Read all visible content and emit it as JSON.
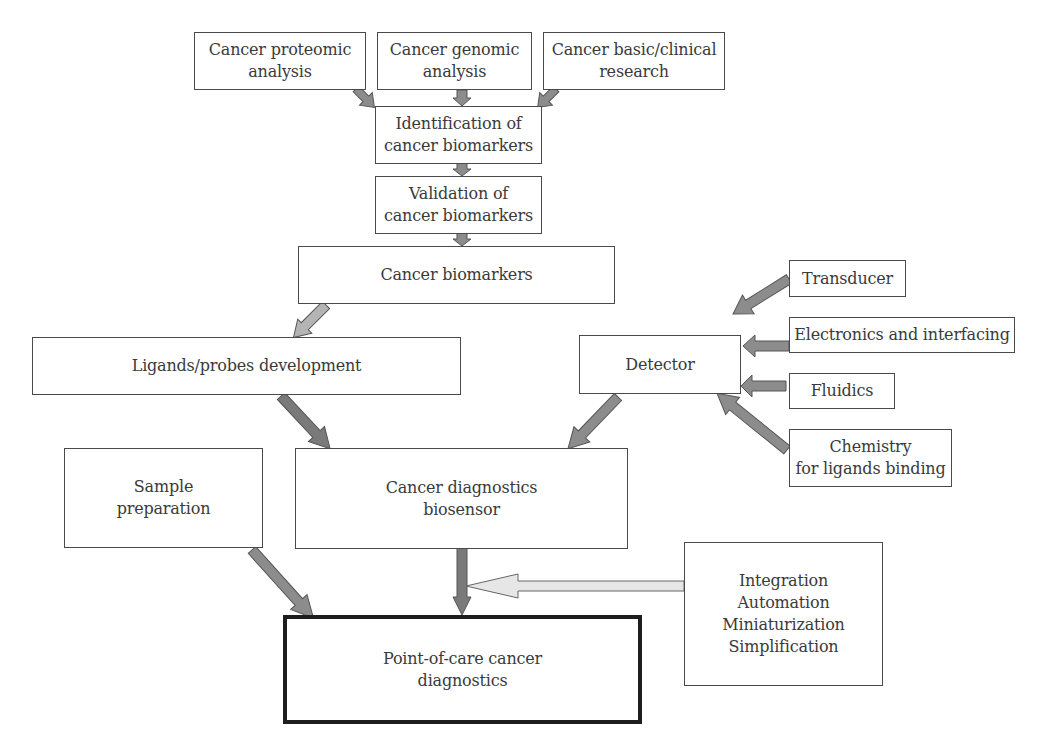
{
  "diagram": {
    "colors": {
      "box_border": "#4a4a4a",
      "final_box_border": "#1e1e1e",
      "arrow_medium": "#8c8c8c",
      "arrow_dark": "#7a7a7a",
      "arrow_light": "#b4b4b4",
      "arrow_pale": "#e6e6e6",
      "arrow_stroke": "#555555"
    },
    "nodes": {
      "proteomic": {
        "lines": [
          "Cancer proteomic",
          "analysis"
        ]
      },
      "genomic": {
        "lines": [
          "Cancer genomic",
          "analysis"
        ]
      },
      "clinical": {
        "lines": [
          "Cancer basic/clinical",
          "research"
        ]
      },
      "identification": {
        "lines": [
          "Identification of",
          "cancer biomarkers"
        ]
      },
      "validation": {
        "lines": [
          "Validation of",
          "cancer biomarkers"
        ]
      },
      "biomarkers": {
        "lines": [
          "Cancer biomarkers"
        ]
      },
      "ligands": {
        "lines": [
          "Ligands/probes development"
        ]
      },
      "detector": {
        "lines": [
          "Detector"
        ]
      },
      "transducer": {
        "lines": [
          "Transducer"
        ]
      },
      "electronics": {
        "lines": [
          "Electronics and interfacing"
        ]
      },
      "fluidics": {
        "lines": [
          "Fluidics"
        ]
      },
      "chemistry": {
        "lines": [
          "Chemistry",
          "for ligands binding"
        ]
      },
      "sample": {
        "lines": [
          "Sample",
          "preparation"
        ]
      },
      "biosensor": {
        "lines": [
          "Cancer diagnostics",
          "biosensor"
        ]
      },
      "integration": {
        "lines": [
          "Integration",
          "Automation",
          "Miniaturization",
          "Simplification"
        ]
      },
      "poc": {
        "lines": [
          "Point-of-care cancer",
          "diagnostics"
        ]
      }
    },
    "edges": [
      {
        "from": "proteomic",
        "to": "identification"
      },
      {
        "from": "genomic",
        "to": "identification"
      },
      {
        "from": "clinical",
        "to": "identification"
      },
      {
        "from": "identification",
        "to": "validation"
      },
      {
        "from": "validation",
        "to": "biomarkers"
      },
      {
        "from": "biomarkers",
        "to": "ligands"
      },
      {
        "from": "transducer",
        "to": "detector"
      },
      {
        "from": "electronics",
        "to": "detector"
      },
      {
        "from": "fluidics",
        "to": "detector"
      },
      {
        "from": "chemistry",
        "to": "detector"
      },
      {
        "from": "ligands",
        "to": "biosensor"
      },
      {
        "from": "detector",
        "to": "biosensor"
      },
      {
        "from": "sample",
        "to": "poc"
      },
      {
        "from": "biosensor",
        "to": "poc"
      },
      {
        "from": "integration",
        "to": "biosensor-poc-link"
      }
    ]
  }
}
